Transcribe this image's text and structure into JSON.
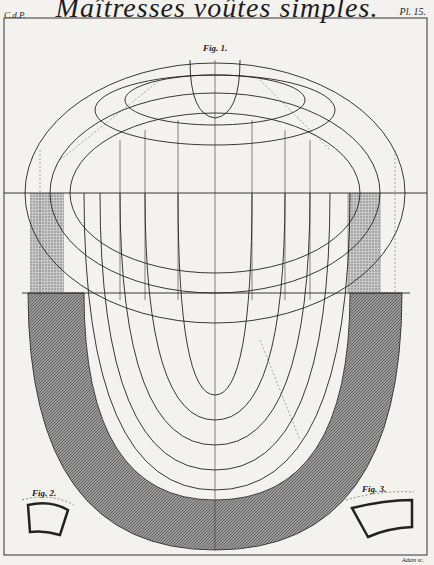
{
  "header": {
    "left": "C.d.P.",
    "title": "Maîtresses voûtes simples.",
    "right": "Pl. 15."
  },
  "figures": {
    "fig1": "Fig. 1.",
    "fig2": "Fig. 2.",
    "fig3": "Fig. 3."
  },
  "credit": "Adam sc.",
  "colors": {
    "ink": "#222222",
    "paper": "#f4f2ee",
    "hatch": "#6b6b6b"
  }
}
